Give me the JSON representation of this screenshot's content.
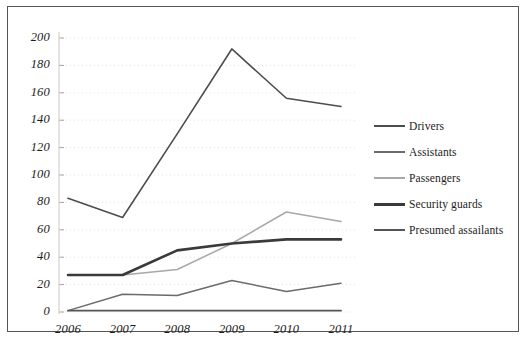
{
  "chart_data": {
    "type": "line",
    "title": "",
    "xlabel": "",
    "ylabel": "",
    "categories": [
      "2006",
      "2007",
      "2008",
      "2009",
      "2010",
      "2011"
    ],
    "ylim": [
      0,
      200
    ],
    "yticks": [
      "0",
      "20",
      "40",
      "60",
      "80",
      "100",
      "120",
      "140",
      "160",
      "180",
      "200"
    ],
    "grid": true,
    "legend_position": "right",
    "series": [
      {
        "name": "Drivers",
        "color": "#4d4d4d",
        "width": 1.6,
        "values": [
          83,
          69,
          130,
          192,
          156,
          150
        ]
      },
      {
        "name": "Assistants",
        "color": "#6b6b6b",
        "width": 1.5,
        "values": [
          1,
          13,
          12,
          23,
          15,
          21
        ]
      },
      {
        "name": "Passengers",
        "color": "#a8a8a8",
        "width": 1.5,
        "values": [
          27,
          27,
          31,
          50,
          73,
          66
        ]
      },
      {
        "name": "Security guards",
        "color": "#3a3a3a",
        "width": 2.6,
        "values": [
          27,
          27,
          45,
          50,
          53,
          53
        ]
      },
      {
        "name": "Presumed assailants",
        "color": "#555555",
        "width": 1.8,
        "values": [
          1,
          1,
          1,
          1,
          1,
          1
        ]
      }
    ]
  }
}
